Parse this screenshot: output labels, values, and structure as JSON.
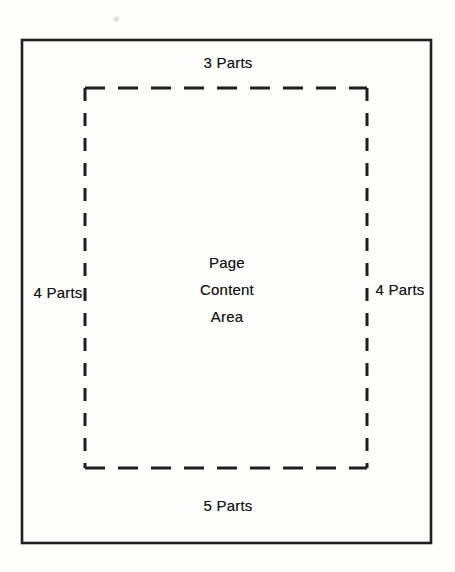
{
  "diagram": {
    "labels": {
      "top_margin": "3 Parts",
      "left_margin": "4 Parts",
      "right_margin": "4 Parts",
      "bottom_margin": "5 Parts",
      "content_area": [
        "Page",
        "Content",
        "Area"
      ]
    },
    "colors": {
      "line": "#1f1f1f",
      "text": "#151515",
      "background": "#fdfdfc"
    }
  }
}
